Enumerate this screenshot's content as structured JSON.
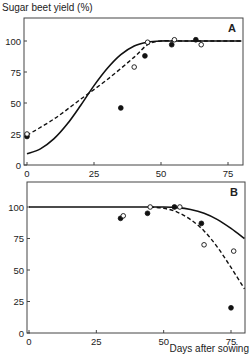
{
  "figure": {
    "ylabel": "Sugar beet yield (%)",
    "xlabel": "Days after sowing"
  },
  "chart_data": [
    {
      "type": "line",
      "panel_label": "A",
      "title": "",
      "xlabel": "",
      "ylabel": "Sugar beet yield (%)",
      "xlim": [
        0,
        80
      ],
      "ylim": [
        0,
        115
      ],
      "xticks": [
        0,
        25,
        50,
        75
      ],
      "yticks": [
        0,
        25,
        50,
        75,
        100
      ],
      "grid": false,
      "series": [
        {
          "name": "fitted curve (solid)",
          "style": "solid",
          "x": [
            0,
            5,
            10,
            15,
            20,
            25,
            30,
            35,
            40,
            45,
            50,
            55,
            60,
            70,
            80
          ],
          "y": [
            9,
            13,
            21,
            33,
            48,
            64,
            78,
            89,
            96,
            99,
            100,
            100,
            100,
            100,
            100
          ]
        },
        {
          "name": "fitted curve (dashed)",
          "style": "dashed",
          "x": [
            0,
            10,
            20,
            30,
            40,
            45,
            50,
            60,
            70,
            80
          ],
          "y": [
            24,
            37,
            53,
            69,
            87,
            97,
            100,
            100,
            100,
            100
          ]
        },
        {
          "name": "observed (filled)",
          "style": "marker-filled",
          "x": [
            0,
            35,
            44,
            54,
            63
          ],
          "y": [
            23,
            46,
            88,
            97,
            101
          ]
        },
        {
          "name": "observed (open)",
          "style": "marker-open",
          "x": [
            0,
            40,
            45,
            55,
            65
          ],
          "y": [
            25,
            79,
            99,
            101,
            97
          ]
        }
      ]
    },
    {
      "type": "line",
      "panel_label": "B",
      "title": "",
      "xlabel": "Days after sowing",
      "ylabel": "Sugar beet yield (%)",
      "xlim": [
        0,
        80
      ],
      "ylim": [
        0,
        115
      ],
      "xticks": [
        0,
        25,
        50,
        75
      ],
      "yticks": [
        0,
        25,
        50,
        75,
        100
      ],
      "grid": false,
      "series": [
        {
          "name": "fitted curve (solid)",
          "style": "solid",
          "x": [
            0,
            20,
            40,
            50,
            55,
            60,
            65,
            70,
            75,
            80
          ],
          "y": [
            100,
            100,
            100,
            100,
            99.5,
            98,
            95,
            90,
            83,
            75
          ]
        },
        {
          "name": "fitted curve (dashed)",
          "style": "dashed",
          "x": [
            45,
            50,
            55,
            60,
            65,
            70,
            75,
            80
          ],
          "y": [
            100,
            99,
            96,
            90,
            81,
            68,
            52,
            35
          ]
        },
        {
          "name": "observed (filled)",
          "style": "marker-filled",
          "x": [
            34,
            44,
            54,
            64,
            75
          ],
          "y": [
            91,
            95,
            100,
            87,
            20
          ]
        },
        {
          "name": "observed (open)",
          "style": "marker-open",
          "x": [
            35,
            45,
            56,
            65,
            76
          ],
          "y": [
            93,
            100,
            100,
            70,
            65
          ]
        }
      ]
    }
  ]
}
